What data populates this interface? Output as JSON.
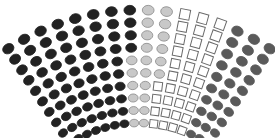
{
  "chart_data": {
    "type": "parliament",
    "title": "",
    "layout": {
      "columns": 16,
      "rows": 10,
      "center_x": 139,
      "center_y": 250,
      "outer_radius": 240,
      "inner_radius": 127,
      "arc_start_deg": -33,
      "arc_end_deg": 33
    },
    "parties": [
      {
        "key": "dark",
        "name": "Party A",
        "shape": "circle",
        "fill": "#222222",
        "stroke": "#222222"
      },
      {
        "key": "light",
        "name": "Party B",
        "shape": "circle",
        "fill": "#c8c8c8",
        "stroke": "#8a8a8a"
      },
      {
        "key": "square",
        "name": "Party C",
        "shape": "square",
        "fill": "#ffffff",
        "stroke": "#6a6a6a"
      },
      {
        "key": "grey",
        "name": "Party D",
        "shape": "circle",
        "fill": "#5a5a5a",
        "stroke": "#5a5a5a"
      }
    ],
    "rows_composition": [
      {
        "dark": 8,
        "light": 2,
        "square": 3,
        "grey": 3
      },
      {
        "dark": 8,
        "light": 2,
        "square": 3,
        "grey": 3
      },
      {
        "dark": 8,
        "light": 2,
        "square": 3,
        "grey": 3
      },
      {
        "dark": 8,
        "light": 2,
        "square": 3,
        "grey": 3
      },
      {
        "dark": 7,
        "light": 3,
        "square": 3,
        "grey": 3
      },
      {
        "dark": 7,
        "light": 3,
        "square": 3,
        "grey": 3
      },
      {
        "dark": 7,
        "light": 2,
        "square": 4,
        "grey": 3
      },
      {
        "dark": 7,
        "light": 2,
        "square": 4,
        "grey": 3
      },
      {
        "dark": 7,
        "light": 2,
        "square": 4,
        "grey": 3
      },
      {
        "dark": 7,
        "light": 2,
        "square": 4,
        "grey": 3
      }
    ],
    "totals": {
      "dark": 74,
      "light": 22,
      "square": 34,
      "grey": 30
    },
    "legend": "none",
    "grid": false
  }
}
